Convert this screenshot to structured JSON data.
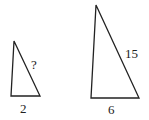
{
  "diagram": {
    "small_triangle": {
      "points": [
        [
          14,
          41
        ],
        [
          11,
          96
        ],
        [
          40,
          96
        ]
      ],
      "labels": {
        "hypotenuse": "?",
        "base": "2"
      }
    },
    "large_triangle": {
      "points": [
        [
          96,
          5
        ],
        [
          91,
          98
        ],
        [
          139,
          98
        ]
      ],
      "labels": {
        "hypotenuse": "15",
        "base": "6"
      }
    },
    "colors": {
      "stroke": "#222222",
      "background": "#ffffff"
    }
  }
}
